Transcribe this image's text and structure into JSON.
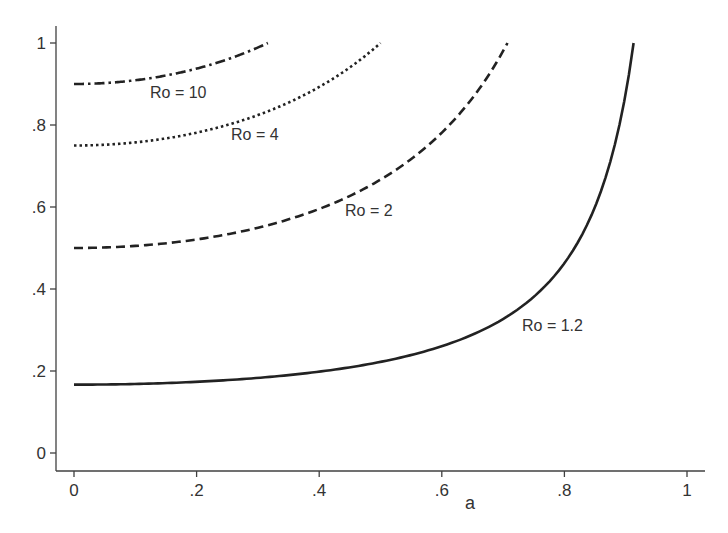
{
  "chart_data": {
    "type": "line",
    "title": "",
    "xlabel": "a",
    "ylabel": "",
    "xlim": [
      0,
      1
    ],
    "ylim": [
      0,
      1
    ],
    "grid": false,
    "legend": "none (inline curve labels)",
    "x_ticks": [
      "0",
      ".2",
      ".4",
      ".6",
      ".8",
      "1"
    ],
    "x_tick_values": [
      0,
      0.2,
      0.4,
      0.6,
      0.8,
      1
    ],
    "y_ticks": [
      "0",
      ".2",
      ".4",
      ".6",
      ".8",
      "1"
    ],
    "y_tick_values": [
      0,
      0.2,
      0.4,
      0.6,
      0.8,
      1
    ],
    "series": [
      {
        "name": "Ro = 10",
        "Ro": 10,
        "style": "dash-dot",
        "x": [
          0,
          0.05,
          0.1,
          0.15,
          0.2,
          0.25,
          0.3,
          0.316
        ],
        "values": [
          0.9,
          0.902,
          0.909,
          0.921,
          0.938,
          0.96,
          0.989,
          1.0
        ],
        "label_pos": {
          "x": 150,
          "y": 98
        }
      },
      {
        "name": "Ro = 4",
        "Ro": 4,
        "style": "dotted",
        "x": [
          0,
          0.1,
          0.2,
          0.3,
          0.4,
          0.5
        ],
        "values": [
          0.75,
          0.758,
          0.781,
          0.824,
          0.893,
          1.0
        ],
        "label_pos": {
          "x": 231,
          "y": 140
        }
      },
      {
        "name": "Ro = 2",
        "Ro": 2,
        "style": "dashed",
        "x": [
          0,
          0.1,
          0.2,
          0.3,
          0.4,
          0.5,
          0.6,
          0.707
        ],
        "values": [
          0.5,
          0.505,
          0.521,
          0.549,
          0.595,
          0.667,
          0.781,
          1.0
        ],
        "label_pos": {
          "x": 345,
          "y": 216
        }
      },
      {
        "name": "Ro = 1.2",
        "Ro": 1.2,
        "style": "solid",
        "x": [
          0,
          0.1,
          0.2,
          0.3,
          0.4,
          0.5,
          0.6,
          0.7,
          0.8,
          0.85,
          0.9,
          0.913
        ],
        "values": [
          0.167,
          0.168,
          0.174,
          0.183,
          0.198,
          0.222,
          0.26,
          0.327,
          0.463,
          0.6,
          0.877,
          1.0
        ],
        "label_pos": {
          "x": 522,
          "y": 331
        }
      }
    ]
  },
  "axes": {
    "x_title": "a"
  }
}
